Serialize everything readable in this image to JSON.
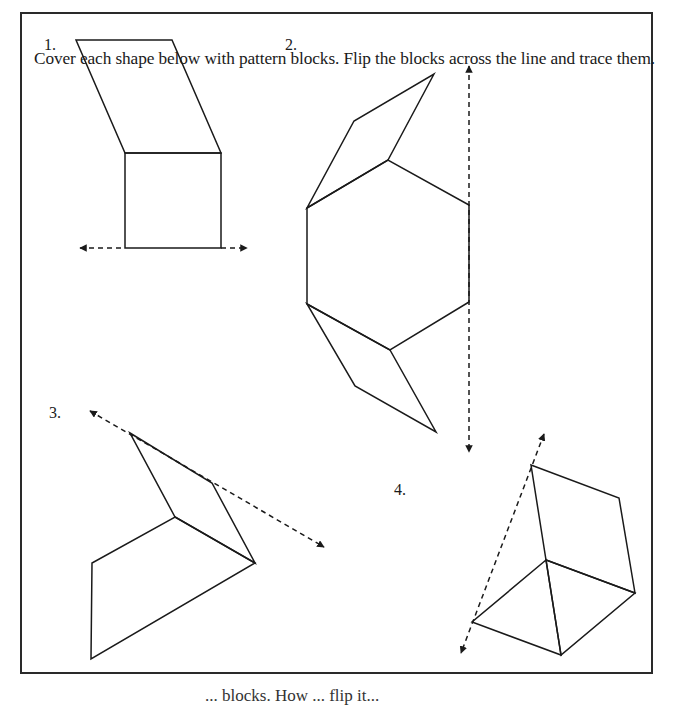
{
  "worksheet": {
    "instructions": "Cover each shape below with pattern blocks. Flip the blocks across the line and trace them.",
    "problems": [
      {
        "number": "1.",
        "shapes": [
          "rhombus",
          "square"
        ],
        "line_of_reflection": "horizontal"
      },
      {
        "number": "2.",
        "shapes": [
          "rhombus",
          "hexagon",
          "rhombus"
        ],
        "line_of_reflection": "vertical"
      },
      {
        "number": "3.",
        "shapes": [
          "rhombus",
          "trapezoid"
        ],
        "line_of_reflection": "diagonal"
      },
      {
        "number": "4.",
        "shapes": [
          "square",
          "triangle",
          "triangle"
        ],
        "line_of_reflection": "diagonal"
      }
    ],
    "footer_partial": "... blocks. How ... flip it..."
  },
  "colors": {
    "line": "#1a1a1a",
    "frame": "#2a2a2a",
    "background": "#ffffff"
  }
}
